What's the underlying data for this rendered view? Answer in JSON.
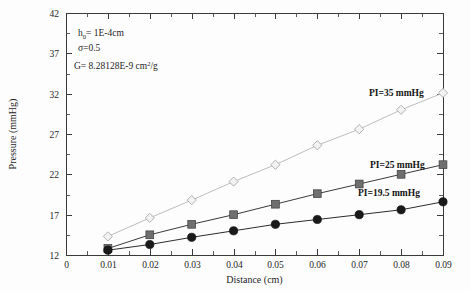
{
  "figure": {
    "background_color": "#fdfdfd",
    "frame_color": "#3a3a3a"
  },
  "chart_data": {
    "type": "line",
    "title": "",
    "xlabel": "Distance  (cm)",
    "ylabel": "Pressure (mmHg)",
    "xlim": [
      0,
      0.09
    ],
    "ylim": [
      12,
      42
    ],
    "grid": false,
    "legend_position": "inline-right",
    "x_tick_labels": [
      "0",
      "0.01",
      "0.02",
      "0.03",
      "0.04",
      "0.05",
      "0.06",
      "0.07",
      "0.08",
      "0.09"
    ],
    "x_tick_values": [
      0,
      0.01,
      0.02,
      0.03,
      0.04,
      0.05,
      0.06,
      0.07,
      0.08,
      0.09
    ],
    "y_tick_labels": [
      "12",
      "17",
      "22",
      "27",
      "32",
      "37",
      "42"
    ],
    "y_tick_values": [
      12,
      17,
      22,
      27,
      32,
      37,
      42
    ],
    "x": [
      0.01,
      0.02,
      0.03,
      0.04,
      0.05,
      0.06,
      0.07,
      0.08,
      0.09
    ],
    "series": [
      {
        "name": "PI=35 mmHg",
        "label": "PI=35 mmHg",
        "marker": "diamond-open",
        "color": "#b9b9b9",
        "line_color": "#bdbdbd",
        "values": [
          14.3,
          16.6,
          18.8,
          21.1,
          23.2,
          25.6,
          27.6,
          30.0,
          32.1
        ]
      },
      {
        "name": "PI=25 mmHg",
        "label": "PI=25 mmHg",
        "marker": "square-filled",
        "color": "#6f6f6f",
        "line_color": "#3a3a3a",
        "values": [
          12.8,
          14.5,
          15.8,
          17.0,
          18.3,
          19.6,
          20.8,
          22.0,
          23.2
        ]
      },
      {
        "name": "PI=19.5 mmHg",
        "label": "PI=19.5 mmHg",
        "marker": "circle-filled",
        "color": "#1a1a1a",
        "line_color": "#2c2c2c",
        "values": [
          12.6,
          13.3,
          14.2,
          15.0,
          15.8,
          16.4,
          17.0,
          17.6,
          18.6
        ]
      }
    ],
    "annotations": [
      {
        "id": "h0",
        "text": "h",
        "sub": "0",
        "rest": "= 1E-4cm"
      },
      {
        "id": "sigma",
        "text": "σ=0.5"
      },
      {
        "id": "shear",
        "text": "G= 8.28128E-9 cm",
        "sup": "2",
        "rest": "/g"
      }
    ]
  },
  "axis_titles": {
    "x": "Distance  (cm)",
    "y": "Pressure (mmHg)"
  }
}
